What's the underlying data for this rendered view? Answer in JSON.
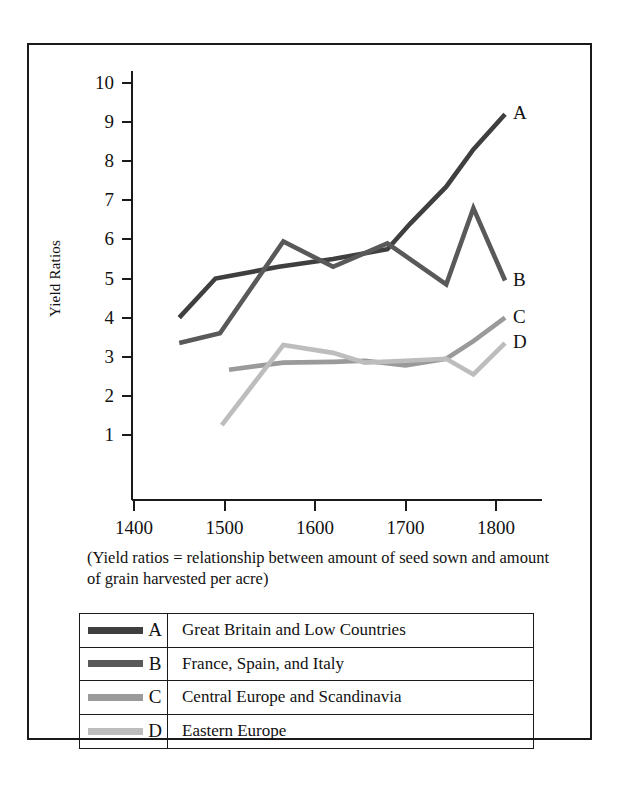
{
  "figure": {
    "caption": "(Yield ratios = relationship between amount of seed sown and amount of grain harvested per acre)"
  },
  "chart_data": {
    "type": "line",
    "title": "",
    "xlabel": "",
    "ylabel": "Yield Ratios",
    "xlim": [
      1380,
      1835
    ],
    "ylim": [
      0,
      10.4
    ],
    "xticks": [
      1400,
      1500,
      1600,
      1700,
      1800
    ],
    "xtick_labels": [
      "1400",
      "1500",
      "1600",
      "1700",
      "1800"
    ],
    "yticks": [
      1,
      2,
      3,
      4,
      5,
      6,
      7,
      8,
      9,
      10
    ],
    "ytick_labels": [
      "1",
      "2",
      "3",
      "4",
      "5",
      "6",
      "7",
      "8",
      "9",
      "10"
    ],
    "grid": false,
    "legend_position": "below-caption",
    "series": [
      {
        "key": "A",
        "name": "Great Britain and Low Countries",
        "color": "#3f3f3f",
        "end_label": "A",
        "x": [
          1450,
          1490,
          1560,
          1620,
          1680,
          1705,
          1745,
          1775,
          1810
        ],
        "y": [
          4.0,
          5.0,
          5.3,
          5.5,
          5.75,
          6.4,
          7.35,
          8.3,
          9.2
        ]
      },
      {
        "key": "B",
        "name": "France, Spain, and Italy",
        "color": "#595959",
        "end_label": "B",
        "x": [
          1450,
          1495,
          1565,
          1620,
          1680,
          1745,
          1775,
          1810
        ],
        "y": [
          3.35,
          3.6,
          5.95,
          5.3,
          5.9,
          4.85,
          6.8,
          4.95
        ]
      },
      {
        "key": "C",
        "name": "Central Europe and Scandinavia",
        "color": "#9a9a9a",
        "end_label": "C",
        "x": [
          1505,
          1565,
          1620,
          1655,
          1700,
          1745,
          1775,
          1810
        ],
        "y": [
          2.67,
          2.85,
          2.87,
          2.9,
          2.78,
          2.95,
          3.4,
          4.0
        ]
      },
      {
        "key": "D",
        "name": "Eastern Europe",
        "color": "#bdbdbd",
        "end_label": "D",
        "x": [
          1497,
          1565,
          1620,
          1655,
          1700,
          1745,
          1775,
          1810
        ],
        "y": [
          1.25,
          3.3,
          3.1,
          2.85,
          2.9,
          2.95,
          2.55,
          3.35
        ]
      }
    ]
  },
  "legend": {
    "rows": [
      {
        "letter": "A",
        "description": "Great Britain and Low Countries",
        "color": "#3f3f3f"
      },
      {
        "letter": "B",
        "description": "France, Spain, and Italy",
        "color": "#595959"
      },
      {
        "letter": "C",
        "description": "Central Europe and Scandinavia",
        "color": "#9a9a9a"
      },
      {
        "letter": "D",
        "description": "Eastern Europe",
        "color": "#bdbdbd"
      }
    ]
  }
}
